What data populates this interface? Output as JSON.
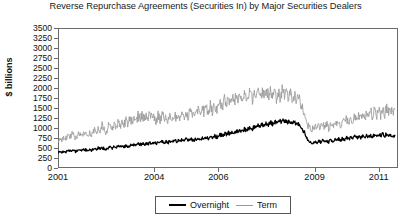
{
  "chart_data": {
    "type": "line",
    "title": "Reverse Repurchase Agreements (Securities In) by Major Securities Dealers",
    "xlabel": "",
    "ylabel": "$ billions",
    "ylim": [
      0,
      3500
    ],
    "xlim": [
      2001,
      2011.6
    ],
    "grid": false,
    "legend_position": "bottom-center",
    "yticks": [
      3500,
      3250,
      3000,
      2750,
      2500,
      2250,
      2000,
      1750,
      1500,
      1250,
      1000,
      750,
      500,
      250,
      0
    ],
    "ytick_labels": [
      "3500",
      "3250",
      "3000",
      "2750",
      "2500",
      "2250",
      "2000",
      "1750",
      "1500",
      "1250",
      "1000",
      "750",
      "500",
      "250",
      "0"
    ],
    "xticks": [
      2001,
      2004,
      2006,
      2009,
      2011
    ],
    "xtick_labels": [
      "2001",
      "2004",
      "2006",
      "2009",
      "2011"
    ],
    "colors": {
      "overnight": "#000000",
      "term": "#9a9a9a"
    },
    "series": [
      {
        "name": "Overnight",
        "color": "#000000",
        "x": [
          2001.0,
          2001.06,
          2001.12,
          2001.19,
          2001.25,
          2001.31,
          2001.37,
          2001.44,
          2001.5,
          2001.56,
          2001.62,
          2001.69,
          2001.75,
          2001.81,
          2001.87,
          2001.94,
          2002.0,
          2002.06,
          2002.12,
          2002.19,
          2002.25,
          2002.31,
          2002.37,
          2002.44,
          2002.5,
          2002.56,
          2002.62,
          2002.69,
          2002.75,
          2002.81,
          2002.87,
          2002.94,
          2003.0,
          2003.06,
          2003.12,
          2003.19,
          2003.25,
          2003.31,
          2003.37,
          2003.44,
          2003.5,
          2003.56,
          2003.62,
          2003.69,
          2003.75,
          2003.81,
          2003.87,
          2003.94,
          2004.0,
          2004.06,
          2004.12,
          2004.19,
          2004.25,
          2004.31,
          2004.37,
          2004.44,
          2004.5,
          2004.56,
          2004.62,
          2004.69,
          2004.75,
          2004.81,
          2004.87,
          2004.94,
          2005.0,
          2005.06,
          2005.12,
          2005.19,
          2005.25,
          2005.31,
          2005.37,
          2005.44,
          2005.5,
          2005.56,
          2005.62,
          2005.69,
          2005.75,
          2005.81,
          2005.87,
          2005.94,
          2006.0,
          2006.06,
          2006.12,
          2006.19,
          2006.25,
          2006.31,
          2006.37,
          2006.44,
          2006.5,
          2006.56,
          2006.62,
          2006.69,
          2006.75,
          2006.81,
          2006.87,
          2006.94,
          2007.0,
          2007.06,
          2007.12,
          2007.19,
          2007.25,
          2007.31,
          2007.37,
          2007.44,
          2007.5,
          2007.56,
          2007.62,
          2007.69,
          2007.75,
          2007.81,
          2007.87,
          2007.94,
          2008.0,
          2008.06,
          2008.12,
          2008.19,
          2008.25,
          2008.31,
          2008.37,
          2008.44,
          2008.5,
          2008.56,
          2008.62,
          2008.69,
          2008.75,
          2008.81,
          2008.87,
          2008.94,
          2009.0,
          2009.06,
          2009.12,
          2009.19,
          2009.25,
          2009.31,
          2009.37,
          2009.44,
          2009.5,
          2009.56,
          2009.62,
          2009.69,
          2009.75,
          2009.81,
          2009.87,
          2009.94,
          2010.0,
          2010.06,
          2010.12,
          2010.19,
          2010.25,
          2010.31,
          2010.37,
          2010.44,
          2010.5,
          2010.56,
          2010.62,
          2010.69,
          2010.75,
          2010.81,
          2010.87,
          2010.94,
          2011.0,
          2011.06,
          2011.12,
          2011.19,
          2011.25,
          2011.31,
          2011.37,
          2011.44,
          2011.5
        ],
        "values": [
          380,
          410,
          395,
          430,
          405,
          440,
          420,
          455,
          430,
          400,
          445,
          460,
          435,
          470,
          450,
          425,
          470,
          440,
          485,
          465,
          500,
          475,
          510,
          485,
          460,
          505,
          525,
          495,
          530,
          505,
          540,
          515,
          545,
          520,
          560,
          535,
          575,
          550,
          585,
          560,
          600,
          575,
          610,
          585,
          625,
          600,
          635,
          610,
          640,
          615,
          655,
          630,
          670,
          645,
          660,
          635,
          675,
          650,
          690,
          665,
          700,
          675,
          715,
          690,
          720,
          695,
          735,
          710,
          700,
          725,
          745,
          715,
          760,
          730,
          775,
          745,
          790,
          760,
          805,
          775,
          800,
          830,
          805,
          860,
          835,
          880,
          850,
          905,
          870,
          925,
          895,
          950,
          915,
          975,
          940,
          990,
          1010,
          980,
          1040,
          1005,
          1070,
          1035,
          1100,
          1060,
          1125,
          1085,
          1150,
          1110,
          1175,
          1135,
          1190,
          1150,
          1205,
          1160,
          1185,
          1140,
          1165,
          1120,
          1145,
          1100,
          1120,
          1060,
          980,
          870,
          760,
          690,
          640,
          610,
          650,
          620,
          680,
          645,
          700,
          660,
          690,
          650,
          705,
          665,
          720,
          680,
          735,
          690,
          745,
          700,
          760,
          715,
          770,
          725,
          785,
          740,
          795,
          750,
          805,
          760,
          815,
          770,
          825,
          780,
          835,
          790,
          845,
          800,
          855,
          810,
          860,
          815,
          845,
          805,
          820
        ]
      },
      {
        "name": "Term",
        "color": "#9a9a9a",
        "x": [
          2001.0,
          2001.06,
          2001.12,
          2001.19,
          2001.25,
          2001.31,
          2001.37,
          2001.44,
          2001.5,
          2001.56,
          2001.62,
          2001.69,
          2001.75,
          2001.81,
          2001.87,
          2001.94,
          2002.0,
          2002.06,
          2002.12,
          2002.19,
          2002.25,
          2002.31,
          2002.37,
          2002.44,
          2002.5,
          2002.56,
          2002.62,
          2002.69,
          2002.75,
          2002.81,
          2002.87,
          2002.94,
          2003.0,
          2003.06,
          2003.12,
          2003.19,
          2003.25,
          2003.31,
          2003.37,
          2003.44,
          2003.5,
          2003.56,
          2003.62,
          2003.69,
          2003.75,
          2003.81,
          2003.87,
          2003.94,
          2004.0,
          2004.06,
          2004.12,
          2004.19,
          2004.25,
          2004.31,
          2004.37,
          2004.44,
          2004.5,
          2004.56,
          2004.62,
          2004.69,
          2004.75,
          2004.81,
          2004.87,
          2004.94,
          2005.0,
          2005.06,
          2005.12,
          2005.19,
          2005.25,
          2005.31,
          2005.37,
          2005.44,
          2005.5,
          2005.56,
          2005.62,
          2005.69,
          2005.75,
          2005.81,
          2005.87,
          2005.94,
          2006.0,
          2006.06,
          2006.12,
          2006.19,
          2006.25,
          2006.31,
          2006.37,
          2006.44,
          2006.5,
          2006.56,
          2006.62,
          2006.69,
          2006.75,
          2006.81,
          2006.87,
          2006.94,
          2007.0,
          2007.06,
          2007.12,
          2007.19,
          2007.25,
          2007.31,
          2007.37,
          2007.44,
          2007.5,
          2007.56,
          2007.62,
          2007.69,
          2007.75,
          2007.81,
          2007.87,
          2007.94,
          2008.0,
          2008.06,
          2008.12,
          2008.19,
          2008.25,
          2008.31,
          2008.37,
          2008.44,
          2008.5,
          2008.56,
          2008.62,
          2008.69,
          2008.75,
          2008.81,
          2008.87,
          2008.94,
          2009.0,
          2009.06,
          2009.12,
          2009.19,
          2009.25,
          2009.31,
          2009.37,
          2009.44,
          2009.5,
          2009.56,
          2009.62,
          2009.69,
          2009.75,
          2009.81,
          2009.87,
          2009.94,
          2010.0,
          2010.06,
          2010.12,
          2010.19,
          2010.25,
          2010.31,
          2010.37,
          2010.44,
          2010.5,
          2010.56,
          2010.62,
          2010.69,
          2010.75,
          2010.81,
          2010.87,
          2010.94,
          2011.0,
          2011.06,
          2011.12,
          2011.19,
          2011.25,
          2011.31,
          2011.37,
          2011.44,
          2011.5
        ],
        "values": [
          700,
          760,
          720,
          810,
          750,
          840,
          780,
          870,
          800,
          750,
          860,
          900,
          830,
          930,
          870,
          810,
          900,
          840,
          960,
          890,
          1010,
          930,
          1060,
          980,
          900,
          1030,
          1090,
          1000,
          1110,
          1030,
          1140,
          1060,
          1160,
          1070,
          1200,
          1100,
          1250,
          1140,
          1280,
          1170,
          1310,
          1200,
          1340,
          1220,
          1370,
          1250,
          1390,
          1270,
          1280,
          1180,
          1310,
          1200,
          1340,
          1220,
          1300,
          1190,
          1330,
          1210,
          1360,
          1230,
          1380,
          1250,
          1400,
          1270,
          1420,
          1290,
          1450,
          1310,
          1280,
          1340,
          1480,
          1330,
          1510,
          1360,
          1540,
          1380,
          1570,
          1400,
          1600,
          1430,
          1580,
          1660,
          1500,
          1720,
          1560,
          1760,
          1600,
          1800,
          1630,
          1840,
          1660,
          1880,
          1700,
          1900,
          1720,
          1870,
          1840,
          1700,
          1880,
          1730,
          1910,
          1750,
          1950,
          1780,
          1980,
          1800,
          1960,
          1790,
          1930,
          1760,
          1900,
          1740,
          1990,
          1800,
          1950,
          1770,
          1900,
          1730,
          1870,
          1700,
          1780,
          1620,
          1480,
          1300,
          1150,
          1060,
          1010,
          980,
          1050,
          990,
          1080,
          1010,
          1110,
          1030,
          1090,
          1000,
          1120,
          1040,
          1150,
          1060,
          1180,
          1080,
          1200,
          1100,
          1240,
          1130,
          1270,
          1160,
          1300,
          1180,
          1330,
          1200,
          1360,
          1230,
          1390,
          1250,
          1420,
          1280,
          1450,
          1300,
          1480,
          1330,
          1510,
          1350,
          1530,
          1370,
          1500,
          1340,
          1470
        ]
      }
    ]
  },
  "legend": {
    "entries": [
      {
        "label": "Overnight",
        "marker": "line-swatch-black"
      },
      {
        "label": "Term",
        "marker": "line-swatch-gray"
      }
    ]
  }
}
